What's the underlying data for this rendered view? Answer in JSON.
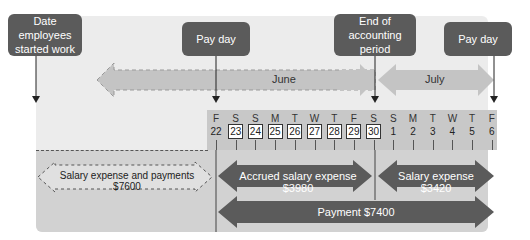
{
  "callouts": {
    "start": "Date employees started work",
    "payday1": "Pay day",
    "end_period": "End of accounting period",
    "payday2": "Pay day"
  },
  "months": {
    "june": "June",
    "july": "July"
  },
  "calendar": {
    "days": [
      "F",
      "S",
      "S",
      "M",
      "T",
      "W",
      "T",
      "F",
      "S",
      "S",
      "M",
      "T",
      "W",
      "T",
      "F"
    ],
    "dates": [
      "22",
      "23",
      "24",
      "25",
      "26",
      "27",
      "28",
      "29",
      "30",
      "1",
      "2",
      "3",
      "4",
      "5",
      "6"
    ],
    "boxed": [
      false,
      true,
      true,
      true,
      true,
      true,
      true,
      true,
      true,
      false,
      false,
      false,
      false,
      false,
      false
    ]
  },
  "bars": {
    "prior": "Salary expense and payments $7600",
    "accrued": "Accrued salary expense $3980",
    "july_expense": "Salary expense $3420",
    "payment": "Payment $7400"
  },
  "colors": {
    "callout": "#5b5b5b",
    "bar": "#5b5b5b",
    "month_arrow": "#bdbdbd"
  }
}
